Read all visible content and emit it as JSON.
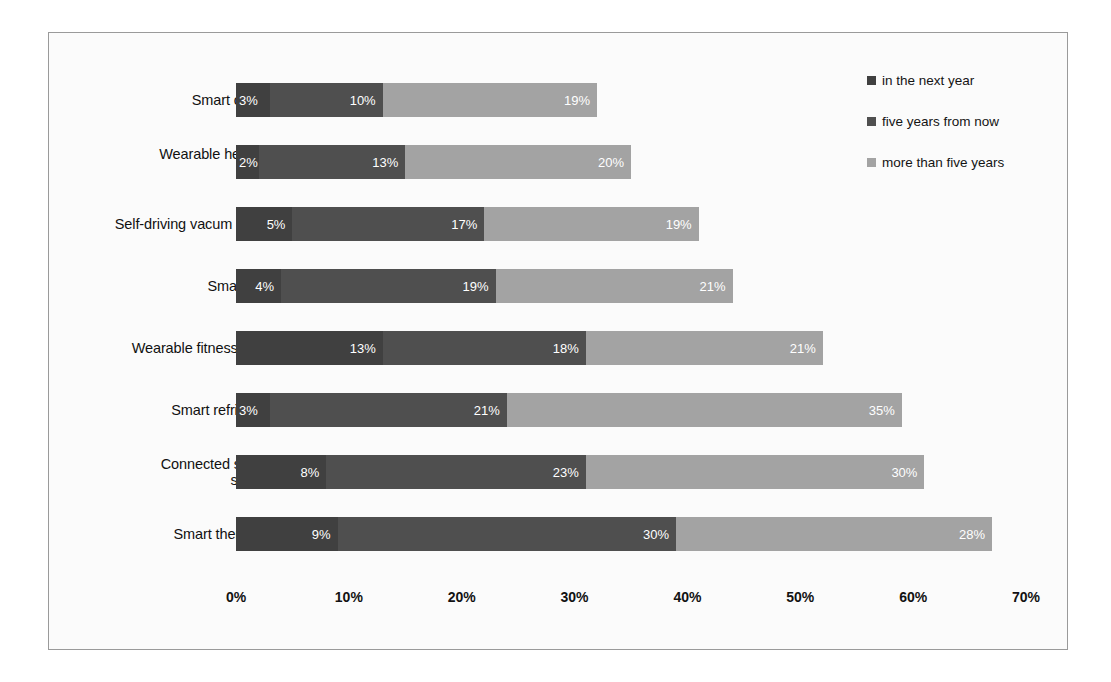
{
  "chart_data": {
    "type": "bar",
    "orientation": "horizontal",
    "stacked": true,
    "title": "",
    "xlabel": "",
    "ylabel": "",
    "xlim": [
      0,
      70
    ],
    "xticks": [
      "0%",
      "10%",
      "20%",
      "30%",
      "40%",
      "50%",
      "60%",
      "70%"
    ],
    "xtick_values": [
      0,
      10,
      20,
      30,
      40,
      50,
      60,
      70
    ],
    "grid": false,
    "legend_position": "right",
    "categories": [
      "Smart clothing",
      "Wearable heads up\ndisplay",
      "Self-driving vacum cleaner",
      "Smartwatch",
      "Wearable fitness device",
      "Smart refrigerator",
      "Connected security\nsystems",
      "Smart thermostat"
    ],
    "series": [
      {
        "name": "in the next year",
        "color": "#404040",
        "values": [
          3,
          2,
          5,
          4,
          13,
          3,
          8,
          9
        ],
        "labels": [
          "3%",
          "2%",
          "5%",
          "4%",
          "13%",
          "3%",
          "8%",
          "9%"
        ]
      },
      {
        "name": "five years from now",
        "color": "#4f4f4f",
        "values": [
          10,
          13,
          17,
          19,
          18,
          21,
          23,
          30
        ],
        "labels": [
          "10%",
          "13%",
          "17%",
          "19%",
          "18%",
          "21%",
          "23%",
          "30%"
        ]
      },
      {
        "name": "more than five years",
        "color": "#a3a3a3",
        "values": [
          19,
          20,
          19,
          21,
          21,
          35,
          30,
          28
        ],
        "labels": [
          "19%",
          "20%",
          "19%",
          "21%",
          "21%",
          "35%",
          "30%",
          "28%"
        ]
      }
    ],
    "totals": [
      32,
      35,
      41,
      44,
      52,
      59,
      61,
      67
    ]
  },
  "legend": {
    "items": [
      {
        "label": "in the next year",
        "color": "#404040"
      },
      {
        "label": "five years from now",
        "color": "#4f4f4f"
      },
      {
        "label": "more than five years",
        "color": "#a3a3a3"
      }
    ]
  },
  "colors": {
    "frame_border": "#9a9a9a",
    "background": "#fbfbfb",
    "text": "#111111",
    "value_label": "#ffffff"
  }
}
